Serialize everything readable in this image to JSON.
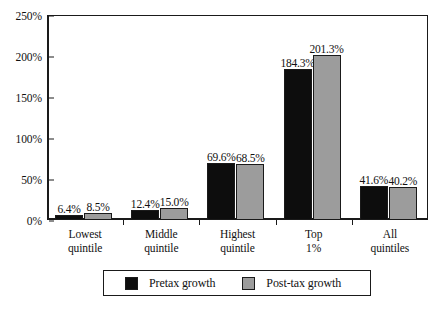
{
  "chart_data": {
    "type": "bar",
    "title": "",
    "xlabel": "",
    "ylabel": "",
    "ylim": [
      0,
      250
    ],
    "y_unit": "%",
    "grid": false,
    "legend_position": "bottom",
    "categories": [
      "Lowest quintile",
      "Middle quintile",
      "Highest quintile",
      "Top 1%",
      "All quintiles"
    ],
    "category_lines": [
      [
        "Lowest",
        "quintile"
      ],
      [
        "Middle",
        "quintile"
      ],
      [
        "Highest",
        "quintile"
      ],
      [
        "Top",
        "1%"
      ],
      [
        "All",
        "quintiles"
      ]
    ],
    "ytick_labels": [
      "0%",
      "50%",
      "100%",
      "150%",
      "200%",
      "250%"
    ],
    "ytick_values": [
      0,
      50,
      100,
      150,
      200,
      250
    ],
    "series": [
      {
        "name": "Pretax growth",
        "color": "#0d0d0d",
        "values": [
          6.4,
          12.4,
          69.6,
          184.3,
          41.6
        ],
        "labels": [
          "6.4%",
          "12.4%",
          "69.6%",
          "184.3%",
          "41.6%"
        ]
      },
      {
        "name": "Post-tax growth",
        "color": "#9c9c9c",
        "values": [
          8.5,
          15.0,
          68.5,
          201.3,
          40.2
        ],
        "labels": [
          "8.5%",
          "15.0%",
          "68.5%",
          "201.3%",
          "40.2%"
        ]
      }
    ]
  },
  "legend": {
    "entries": [
      {
        "label": "Pretax growth",
        "swatch": "black-square-swatch"
      },
      {
        "label": "Post-tax growth",
        "swatch": "gray-square-swatch"
      }
    ]
  }
}
